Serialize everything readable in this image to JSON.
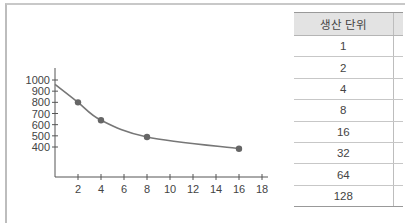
{
  "chart_data": {
    "type": "line",
    "title": "",
    "xlabel": "",
    "ylabel": "",
    "x_ticks": [
      2,
      4,
      6,
      8,
      10,
      12,
      14,
      16,
      18
    ],
    "y_ticks": [
      400,
      500,
      600,
      700,
      800,
      900,
      1000
    ],
    "xlim": [
      0,
      19
    ],
    "ylim": [
      0,
      1100
    ],
    "grid": false,
    "series": [
      {
        "name": "curve",
        "style": "smooth line with markers",
        "x": [
          2,
          4,
          8,
          16
        ],
        "y": [
          800,
          640,
          490,
          385
        ],
        "curve_start": {
          "x": 0,
          "y": 960
        }
      }
    ],
    "colors": {
      "line": "#777777",
      "marker": "#666666",
      "axis": "#555555"
    }
  },
  "table": {
    "header": [
      "생산 단위",
      ""
    ],
    "rows": [
      [
        "1"
      ],
      [
        "2"
      ],
      [
        "4"
      ],
      [
        "8"
      ],
      [
        "16"
      ],
      [
        "32"
      ],
      [
        "64"
      ],
      [
        "128"
      ]
    ]
  }
}
